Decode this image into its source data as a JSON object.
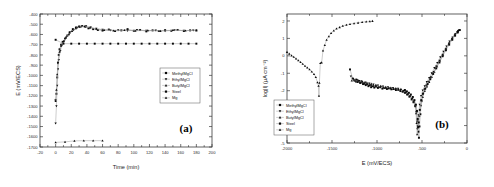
{
  "figure": {
    "panels": [
      {
        "letter": "(a)",
        "xlabel": "Time (min)",
        "ylabel": "E (mV/ECS)",
        "xticks": [
          -20,
          0,
          20,
          40,
          60,
          80,
          100,
          120,
          140,
          160,
          180,
          200
        ],
        "yticks": [
          -400,
          -500,
          -600,
          -700,
          -800,
          -900,
          -1000,
          -1100,
          -1200,
          -1300,
          -1400,
          -1500,
          -1600,
          -1700
        ],
        "xlim": [
          -20,
          200
        ],
        "ylim": [
          -1700,
          -400
        ]
      },
      {
        "letter": "(b)",
        "xlabel": "E (mV/ECS)",
        "ylabel": "log|I| (µA cm⁻²)",
        "xticks": [
          -2000,
          -1500,
          -1000,
          -500,
          0
        ],
        "yticks": [
          2,
          1,
          0,
          -1,
          -2,
          -3,
          -4,
          -5
        ],
        "xlim": [
          -2000,
          0
        ],
        "ylim": [
          -5,
          2.4
        ]
      }
    ],
    "legend": {
      "items": [
        {
          "label": "MethylMgCl",
          "marker": "square"
        },
        {
          "label": "EthylMgCl",
          "marker": "triangle-down"
        },
        {
          "label": "ButylMgCl",
          "marker": "triangle-up"
        },
        {
          "label": "Steel",
          "marker": "square"
        },
        {
          "label": "Mg",
          "marker": "triangle-up"
        }
      ]
    }
  },
  "chart_data": [
    {
      "type": "scatter",
      "title": "",
      "panel": "(a)",
      "xlabel": "Time (min)",
      "ylabel": "E (mV/ECS)",
      "xlim": [
        -20,
        200
      ],
      "ylim": [
        -1700,
        -400
      ],
      "grid": false,
      "legend_position": "center-right",
      "series": [
        {
          "name": "MethylMgCl",
          "x": [
            0,
            1,
            2,
            3,
            4,
            5,
            7,
            9,
            12,
            15,
            18,
            22,
            26,
            30,
            34,
            38,
            42,
            48,
            54,
            60,
            68,
            76,
            84,
            92,
            100,
            108,
            116,
            124,
            132,
            140,
            148,
            156,
            164,
            172,
            180
          ],
          "y": [
            -1240,
            -1180,
            -1020,
            -880,
            -800,
            -745,
            -700,
            -672,
            -640,
            -610,
            -578,
            -548,
            -532,
            -522,
            -518,
            -524,
            -540,
            -548,
            -556,
            -562,
            -552,
            -566,
            -560,
            -548,
            -564,
            -556,
            -570,
            -560,
            -566,
            -558,
            -564,
            -556,
            -566,
            -560,
            -560
          ]
        },
        {
          "name": "EthylMgCl",
          "x": [
            0,
            1,
            2,
            3,
            4,
            6,
            8,
            11,
            14,
            18,
            23,
            28,
            33,
            39,
            45,
            52,
            60,
            70,
            80,
            92,
            104,
            116,
            128,
            140,
            152,
            164,
            176
          ],
          "y": [
            -1470,
            -1300,
            -1100,
            -940,
            -850,
            -760,
            -706,
            -665,
            -625,
            -590,
            -558,
            -534,
            -524,
            -520,
            -530,
            -544,
            -552,
            -560,
            -558,
            -564,
            -556,
            -562,
            -560,
            -566,
            -558,
            -562,
            -560
          ]
        },
        {
          "name": "ButylMgCl",
          "x": [
            0,
            1,
            2,
            3,
            5,
            7,
            10,
            13,
            17,
            21,
            26,
            31,
            37,
            44,
            52,
            62,
            74,
            88,
            102,
            118,
            134,
            150,
            166,
            180
          ],
          "y": [
            -1250,
            -1140,
            -990,
            -870,
            -770,
            -710,
            -668,
            -632,
            -598,
            -566,
            -540,
            -526,
            -520,
            -532,
            -546,
            -556,
            -562,
            -558,
            -564,
            -560,
            -566,
            -558,
            -562,
            -560
          ]
        },
        {
          "name": "Steel",
          "x": [
            0,
            10,
            20,
            30,
            40,
            50,
            60,
            70,
            80,
            90,
            100,
            110,
            120,
            130,
            140,
            150,
            160,
            170,
            180
          ],
          "y": [
            -652,
            -690,
            -690,
            -690,
            -690,
            -690,
            -690,
            -690,
            -690,
            -690,
            -690,
            -690,
            -690,
            -690,
            -690,
            -690,
            -690,
            -690,
            -690
          ]
        },
        {
          "name": "Mg",
          "x": [
            0,
            12,
            24,
            36,
            48,
            60
          ],
          "y": [
            -1655,
            -1650,
            -1640,
            -1638,
            -1638,
            -1638
          ]
        }
      ]
    },
    {
      "type": "scatter",
      "title": "",
      "panel": "(b)",
      "xlabel": "E (mV/ECS)",
      "ylabel": "log|I| (µA cm⁻²)",
      "xlim": [
        -2000,
        0
      ],
      "ylim": [
        -5,
        2.4
      ],
      "grid": false,
      "legend_position": "lower-left",
      "series": [
        {
          "name": "Mg",
          "comment": "cathodic branch descending from -2000 to Ecorr -1645, then anodic branch rising to -1050",
          "x": [
            -2000,
            -1975,
            -1950,
            -1925,
            -1900,
            -1875,
            -1850,
            -1825,
            -1800,
            -1775,
            -1750,
            -1725,
            -1700,
            -1680,
            -1662,
            -1650,
            -1645,
            -1640,
            -1630,
            -1615,
            -1600,
            -1580,
            -1560,
            -1535,
            -1510,
            -1480,
            -1450,
            -1415,
            -1380,
            -1340,
            -1300,
            -1255,
            -1210,
            -1165,
            -1120,
            -1080,
            -1050
          ],
          "y": [
            0.22,
            0.12,
            0.02,
            -0.06,
            -0.16,
            -0.26,
            -0.36,
            -0.46,
            -0.58,
            -0.68,
            -0.78,
            -0.9,
            -1.05,
            -1.22,
            -1.52,
            -1.72,
            -2.3,
            -1.55,
            -0.42,
            -0.38,
            0.3,
            0.62,
            0.92,
            1.12,
            1.3,
            1.45,
            1.56,
            1.64,
            1.72,
            1.78,
            1.82,
            1.86,
            1.9,
            1.93,
            1.96,
            1.98,
            2.0
          ]
        },
        {
          "name": "MethylMgCl",
          "comment": "long shallow cathodic branch from -1300 then sharp V at Ecorr -540 and anodic rise to -70",
          "x": [
            -1300,
            -1270,
            -1250,
            -1230,
            -1215,
            -1200,
            -1185,
            -1170,
            -1155,
            -1140,
            -1125,
            -1110,
            -1095,
            -1080,
            -1065,
            -1050,
            -1030,
            -1010,
            -990,
            -965,
            -940,
            -915,
            -890,
            -865,
            -840,
            -815,
            -790,
            -765,
            -740,
            -715,
            -690,
            -665,
            -640,
            -615,
            -595,
            -575,
            -560,
            -548,
            -540,
            -534,
            -528,
            -518,
            -505,
            -490,
            -470,
            -450,
            -425,
            -400,
            -370,
            -340,
            -305,
            -270,
            -235,
            -200,
            -165,
            -135,
            -105,
            -80
          ],
          "y": [
            -0.78,
            -1.3,
            -1.42,
            -1.36,
            -1.5,
            -1.44,
            -1.56,
            -1.5,
            -1.62,
            -1.56,
            -1.68,
            -1.62,
            -1.74,
            -1.68,
            -1.8,
            -1.74,
            -1.82,
            -1.76,
            -1.84,
            -1.8,
            -1.88,
            -1.84,
            -1.9,
            -1.86,
            -1.92,
            -1.9,
            -1.96,
            -1.94,
            -2.02,
            -2.06,
            -2.12,
            -2.22,
            -2.34,
            -2.5,
            -2.66,
            -2.88,
            -3.2,
            -3.7,
            -4.35,
            -4.7,
            -4.05,
            -3.35,
            -2.6,
            -2.2,
            -1.92,
            -1.7,
            -1.48,
            -1.22,
            -0.92,
            -0.6,
            -0.28,
            0.06,
            0.4,
            0.7,
            0.98,
            1.18,
            1.36,
            1.48
          ]
        },
        {
          "name": "EthylMgCl",
          "comment": "cathodic branch merging near -700, Ecorr -555, anodic branch rising to -90",
          "x": [
            -1290,
            -1265,
            -1240,
            -1218,
            -1196,
            -1174,
            -1152,
            -1130,
            -1108,
            -1086,
            -1064,
            -1040,
            -1015,
            -990,
            -962,
            -934,
            -906,
            -878,
            -850,
            -822,
            -794,
            -766,
            -738,
            -710,
            -684,
            -660,
            -636,
            -612,
            -592,
            -574,
            -562,
            -556,
            -552,
            -546,
            -538,
            -526,
            -510,
            -492,
            -470,
            -446,
            -420,
            -392,
            -362,
            -330,
            -296,
            -262,
            -228,
            -194,
            -160,
            -128,
            -100,
            -90
          ],
          "y": [
            -1.18,
            -1.32,
            -1.46,
            -1.4,
            -1.52,
            -1.46,
            -1.58,
            -1.52,
            -1.64,
            -1.58,
            -1.7,
            -1.64,
            -1.74,
            -1.7,
            -1.8,
            -1.76,
            -1.84,
            -1.8,
            -1.88,
            -1.84,
            -1.92,
            -1.88,
            -1.96,
            -2.02,
            -2.1,
            -2.2,
            -2.32,
            -2.46,
            -2.62,
            -2.86,
            -3.22,
            -3.78,
            -4.2,
            -4.02,
            -3.4,
            -2.8,
            -2.3,
            -1.98,
            -1.74,
            -1.5,
            -1.26,
            -1.0,
            -0.7,
            -0.4,
            -0.08,
            0.24,
            0.54,
            0.82,
            1.06,
            1.26,
            1.4,
            1.45
          ]
        },
        {
          "name": "ButylMgCl",
          "comment": "cathodic branch, Ecorr -565, steeper anodic branch rising to -95",
          "x": [
            -1280,
            -1256,
            -1232,
            -1208,
            -1184,
            -1160,
            -1136,
            -1112,
            -1088,
            -1064,
            -1038,
            -1012,
            -986,
            -958,
            -930,
            -902,
            -874,
            -846,
            -818,
            -790,
            -762,
            -734,
            -706,
            -680,
            -656,
            -632,
            -608,
            -588,
            -572,
            -566,
            -560,
            -554,
            -544,
            -530,
            -512,
            -492,
            -470,
            -446,
            -420,
            -392,
            -362,
            -332,
            -300,
            -266,
            -232,
            -198,
            -164,
            -132,
            -105,
            -95
          ],
          "y": [
            -1.42,
            -1.36,
            -1.48,
            -1.42,
            -1.54,
            -1.48,
            -1.6,
            -1.54,
            -1.66,
            -1.6,
            -1.72,
            -1.66,
            -1.78,
            -1.72,
            -1.82,
            -1.78,
            -1.86,
            -1.82,
            -1.9,
            -1.86,
            -1.94,
            -1.9,
            -2.0,
            -2.08,
            -2.18,
            -2.3,
            -2.44,
            -2.62,
            -2.9,
            -3.3,
            -3.86,
            -4.5,
            -4.1,
            -3.46,
            -2.84,
            -2.36,
            -2.02,
            -1.76,
            -1.5,
            -1.22,
            -0.92,
            -0.6,
            -0.26,
            0.08,
            0.42,
            0.74,
            1.02,
            1.26,
            1.42,
            1.48
          ]
        },
        {
          "name": "Steel",
          "comment": "overlapping scatter in cathodic region near -700 to -520",
          "x": [
            -690,
            -668,
            -646,
            -624,
            -602,
            -584,
            -568,
            -556,
            -548,
            -542,
            -536,
            -524,
            -508,
            -488,
            -464,
            -438,
            -408,
            -376,
            -342,
            -306,
            -270,
            -234,
            -198,
            -164,
            -132,
            -104
          ],
          "y": [
            -1.96,
            -2.04,
            -2.12,
            -2.22,
            -2.36,
            -2.54,
            -2.8,
            -3.16,
            -3.62,
            -4.08,
            -3.82,
            -3.1,
            -2.54,
            -2.16,
            -1.88,
            -1.62,
            -1.34,
            -1.04,
            -0.72,
            -0.38,
            -0.02,
            0.32,
            0.64,
            0.92,
            1.16,
            1.34
          ]
        }
      ]
    }
  ]
}
